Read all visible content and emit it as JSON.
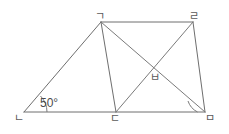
{
  "figure": {
    "stroke_color": "#6e6e6e",
    "background_color": "#ffffff",
    "width": 229,
    "height": 134,
    "vertices": [
      {
        "id": "g",
        "label": "ㄱ",
        "name": "vertex-giyeok",
        "x": 101,
        "y": 22
      },
      {
        "id": "r",
        "label": "ㄹ",
        "name": "vertex-rieul",
        "x": 193,
        "y": 22
      },
      {
        "id": "n",
        "label": "ㄴ",
        "name": "vertex-nieun",
        "x": 24,
        "y": 112
      },
      {
        "id": "d",
        "label": "ㄷ",
        "name": "vertex-digeut",
        "x": 116,
        "y": 112
      },
      {
        "id": "m",
        "label": "ㅁ",
        "name": "vertex-mieum",
        "x": 205,
        "y": 112
      },
      {
        "id": "b",
        "label": "ㅂ",
        "name": "vertex-bieup",
        "x": 153,
        "y": 68
      }
    ],
    "segments": [
      {
        "name": "segment-n-g",
        "from": "n",
        "to": "g",
        "kind": "edge"
      },
      {
        "name": "segment-g-r",
        "from": "g",
        "to": "r",
        "kind": "edge"
      },
      {
        "name": "segment-r-m",
        "from": "r",
        "to": "m",
        "kind": "edge"
      },
      {
        "name": "segment-n-m",
        "from": "n",
        "to": "m",
        "kind": "edge"
      },
      {
        "name": "segment-g-d",
        "from": "g",
        "to": "d",
        "kind": "edge"
      },
      {
        "name": "segment-g-m",
        "from": "g",
        "to": "m",
        "kind": "diagonal"
      },
      {
        "name": "segment-d-r",
        "from": "d",
        "to": "r",
        "kind": "diagonal"
      }
    ],
    "angles": [
      {
        "name": "angle-at-nieun",
        "at": "n",
        "label": "50°",
        "arc": true
      },
      {
        "name": "angle-arc-at-mieum",
        "at": "m",
        "label": "",
        "arc": true
      }
    ]
  }
}
